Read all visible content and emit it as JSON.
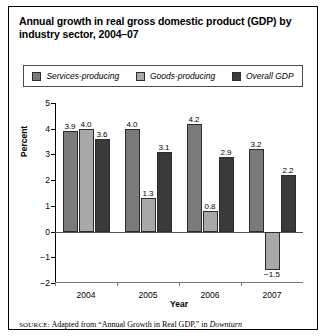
{
  "title": "Annual growth in real gross domestic product (GDP) by industry sector, 2004–07",
  "source": {
    "label": "SOURCE:",
    "text": " Adapted from “Annual Growth in Real GDP,” in ",
    "italic": "Downturn"
  },
  "colors": {
    "services": "#7a7a7a",
    "goods": "#a8a8a8",
    "overall": "#3a3a3a",
    "axis": "#000000",
    "border": "#000000"
  },
  "chart_data": {
    "type": "bar",
    "title": "Annual growth in real gross domestic product (GDP) by industry sector, 2004–07",
    "xlabel": "Year",
    "ylabel": "Percent",
    "categories": [
      "2004",
      "2005",
      "2006",
      "2007"
    ],
    "ylim": [
      -2,
      5
    ],
    "yticks": [
      5,
      4,
      3,
      2,
      1,
      0,
      -1,
      -2
    ],
    "ytick_labels": [
      "5",
      "4",
      "3",
      "2",
      "1",
      "0",
      "−1",
      "−2"
    ],
    "grid": false,
    "legend_position": "top",
    "series": [
      {
        "name": "Services-producing",
        "color": "#7a7a7a",
        "values": [
          3.9,
          4.0,
          4.2,
          3.2
        ],
        "labels": [
          "3.9",
          "4.0",
          "4.2",
          "3.2"
        ]
      },
      {
        "name": "Goods-producing",
        "color": "#a8a8a8",
        "values": [
          4.0,
          1.3,
          0.8,
          -1.5
        ],
        "labels": [
          "4.0",
          "1.3",
          "0.8",
          "−1.5"
        ]
      },
      {
        "name": "Overall GDP",
        "color": "#3a3a3a",
        "values": [
          3.6,
          3.1,
          2.9,
          2.2
        ],
        "labels": [
          "3.6",
          "3.1",
          "2.9",
          "2.2"
        ]
      }
    ]
  }
}
